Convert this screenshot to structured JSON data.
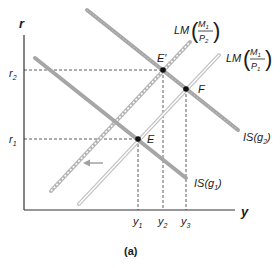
{
  "figure": {
    "caption": "(a)",
    "axes": {
      "y_label": "r",
      "x_label": "y"
    },
    "y_ticks": [
      {
        "id": "r2",
        "base": "r",
        "sub": "2"
      },
      {
        "id": "r1",
        "base": "r",
        "sub": "1"
      }
    ],
    "x_ticks": [
      {
        "id": "y1",
        "base": "y",
        "sub": "1"
      },
      {
        "id": "y2",
        "base": "y",
        "sub": "2"
      },
      {
        "id": "y3",
        "base": "y",
        "sub": "3"
      }
    ],
    "curves": {
      "is_g1": {
        "prefix": "IS(",
        "var": "g",
        "sub": "1",
        "suffix": ")"
      },
      "is_g2": {
        "prefix": "IS(",
        "var": "g",
        "sub": "2",
        "suffix": ")"
      },
      "lm_p1": {
        "prefix": "LM",
        "num": "M",
        "num_sub": "1",
        "den": "P",
        "den_sub": "1"
      },
      "lm_p2": {
        "prefix": "LM",
        "num": "M",
        "num_sub": "1",
        "den": "P",
        "den_sub": "2"
      }
    },
    "points": {
      "E": "E",
      "E_prime": "E′",
      "F": "F"
    },
    "colors": {
      "axis": "#333333",
      "is_curve": "#a6a6a6",
      "lm_curve": "#c8c8c8",
      "lm_inner": "#ffffff",
      "point": "#111111",
      "dashed": "#333333",
      "arrow": "#a0a0a0"
    }
  }
}
